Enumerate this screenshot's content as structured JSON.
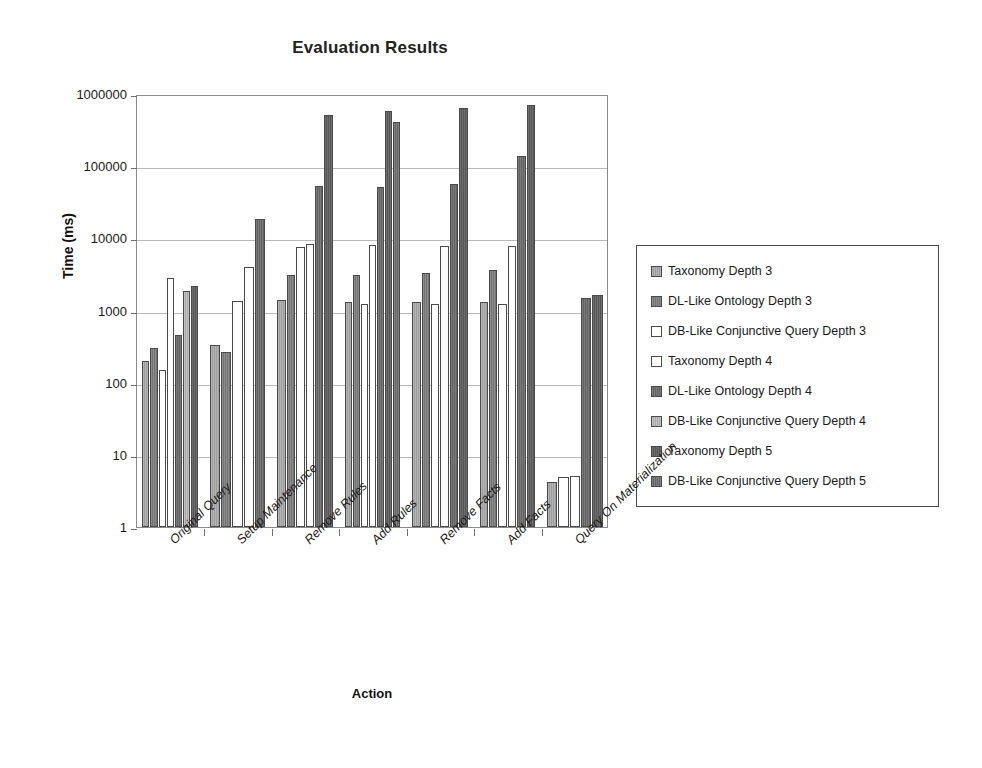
{
  "chart_data": {
    "type": "bar",
    "title": "Evaluation Results",
    "xlabel": "Action",
    "ylabel": "Time (ms)",
    "yscale": "log",
    "ylim": [
      1,
      1000000
    ],
    "ytick_labels": [
      "1000000",
      "100000",
      "10000",
      "1000",
      "100",
      "10",
      "1"
    ],
    "ytick_values": [
      1000000,
      100000,
      10000,
      1000,
      100,
      10,
      1
    ],
    "grid": true,
    "legend_position": "right",
    "categories": [
      "Original Query",
      "Setup Maintenance",
      "Remove Rules",
      "Add Rules",
      "Remove Facts",
      "Add Facts",
      "Query On Materialization"
    ],
    "series": [
      {
        "name": "Taxonomy Depth 3",
        "swatch": "#a8a8a8",
        "values": [
          200,
          330,
          1400,
          1300,
          1300,
          1300,
          4.2
        ]
      },
      {
        "name": "DL-Like Ontology Depth 3",
        "swatch": "#808080",
        "values": [
          300,
          270,
          3100,
          3100,
          3300,
          3700,
          4.3
        ]
      },
      {
        "name": "DB-Like Conjunctive Query Depth 3",
        "swatch": "#ffffff",
        "values": [
          150,
          1350,
          7700,
          1250,
          1250,
          1250,
          5.0
        ]
      },
      {
        "name": "Taxonomy Depth 4",
        "swatch": "#ffffff",
        "values": [
          2800,
          4000,
          8300,
          8200,
          7800,
          7900,
          5.1
        ]
      },
      {
        "name": "DL-Like Ontology Depth 4",
        "swatch": "#6e6e6e",
        "values": [
          460,
          18500,
          53000,
          52000,
          57000,
          140000,
          1500
        ]
      },
      {
        "name": "DB-Like Conjunctive Query Depth 4",
        "swatch": "#b5b5b5",
        "values": [
          1850,
          null,
          8000,
          8000,
          7900,
          8000,
          null
        ]
      },
      {
        "name": "Taxonomy Depth 5",
        "swatch": "#606060",
        "values": [
          2200,
          null,
          520000,
          580000,
          560000,
          700000,
          1650
        ]
      },
      {
        "name": "DB-Like Conjunctive Query Depth 5",
        "swatch": "#757575",
        "values": [
          null,
          null,
          null,
          410000,
          650000,
          null,
          null
        ]
      }
    ],
    "bars": [
      {
        "group": 0,
        "series": 0,
        "value": 200
      },
      {
        "group": 0,
        "series": 1,
        "value": 300
      },
      {
        "group": 0,
        "series": 2,
        "value": 150
      },
      {
        "group": 0,
        "series": 3,
        "value": 2800
      },
      {
        "group": 0,
        "series": 4,
        "value": 460
      },
      {
        "group": 0,
        "series": 5,
        "value": 1850
      },
      {
        "group": 0,
        "series": 6,
        "value": 2200
      },
      {
        "group": 1,
        "series": 0,
        "value": 330
      },
      {
        "group": 1,
        "series": 1,
        "value": 270
      },
      {
        "group": 1,
        "series": 2,
        "value": 1350
      },
      {
        "group": 1,
        "series": 3,
        "value": 4000
      },
      {
        "group": 1,
        "series": 4,
        "value": 18500
      },
      {
        "group": 2,
        "series": 0,
        "value": 1400
      },
      {
        "group": 2,
        "series": 1,
        "value": 3100
      },
      {
        "group": 2,
        "series": 2,
        "value": 7700
      },
      {
        "group": 2,
        "series": 3,
        "value": 8300
      },
      {
        "group": 2,
        "series": 4,
        "value": 53000
      },
      {
        "group": 2,
        "series": 6,
        "value": 520000
      },
      {
        "group": 3,
        "series": 0,
        "value": 1300
      },
      {
        "group": 3,
        "series": 1,
        "value": 3100
      },
      {
        "group": 3,
        "series": 2,
        "value": 1250
      },
      {
        "group": 3,
        "series": 3,
        "value": 8200
      },
      {
        "group": 3,
        "series": 4,
        "value": 52000
      },
      {
        "group": 3,
        "series": 6,
        "value": 580000
      },
      {
        "group": 3,
        "series": 7,
        "value": 410000
      },
      {
        "group": 4,
        "series": 0,
        "value": 1300
      },
      {
        "group": 4,
        "series": 1,
        "value": 3300
      },
      {
        "group": 4,
        "series": 2,
        "value": 1250
      },
      {
        "group": 4,
        "series": 3,
        "value": 7800
      },
      {
        "group": 4,
        "series": 4,
        "value": 57000
      },
      {
        "group": 4,
        "series": 6,
        "value": 650000
      },
      {
        "group": 5,
        "series": 0,
        "value": 1300
      },
      {
        "group": 5,
        "series": 1,
        "value": 3700
      },
      {
        "group": 5,
        "series": 2,
        "value": 1250
      },
      {
        "group": 5,
        "series": 3,
        "value": 7900
      },
      {
        "group": 5,
        "series": 4,
        "value": 140000
      },
      {
        "group": 5,
        "series": 6,
        "value": 700000
      },
      {
        "group": 6,
        "series": 0,
        "value": 4.2
      },
      {
        "group": 6,
        "series": 2,
        "value": 5.0
      },
      {
        "group": 6,
        "series": 3,
        "value": 5.1
      },
      {
        "group": 6,
        "series": 4,
        "value": 1500
      },
      {
        "group": 6,
        "series": 6,
        "value": 1650
      }
    ]
  }
}
